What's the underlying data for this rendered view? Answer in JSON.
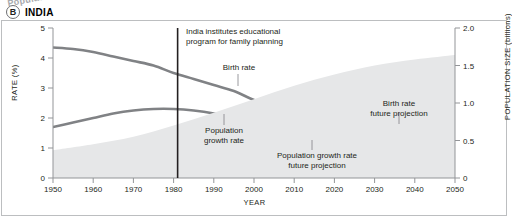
{
  "panel": {
    "letter": "B",
    "title": "INDIA"
  },
  "axes": {
    "left_title": "RATE (%)",
    "right_title": "POPULATION SIZE (billions)",
    "x_title": "YEAR",
    "left_ticks": [
      "0",
      "1",
      "2",
      "3",
      "4",
      "5"
    ],
    "right_ticks": [
      "0",
      "0.5",
      "1.0",
      "1.5",
      "2.0"
    ],
    "x_ticks": [
      "1950",
      "1960",
      "1970",
      "1980",
      "1990",
      "2000",
      "2010",
      "2020",
      "2030",
      "2040",
      "2050"
    ]
  },
  "annotations": {
    "policy_line": "India institutes educational program for family planning",
    "policy_line_1": "India institutes educational",
    "policy_line_2": "program for family planning",
    "birth_rate": "Birth rate",
    "population_growth_rate_1": "Population",
    "population_growth_rate_2": "growth rate",
    "population_size": "Population size",
    "birth_rate_projection_1": "Birth rate",
    "birth_rate_projection_2": "future projection",
    "population_growth_projection_1": "Population growth rate",
    "population_growth_projection_2": "future projection"
  },
  "colors": {
    "line": "#808285",
    "area": "#e6e7e8",
    "marker_line": "#231f20",
    "axis": "#939598",
    "frame": "#bcbec0",
    "popsize_label": "#a7a9ac",
    "text": "#231f20"
  },
  "chart_data": {
    "type": "line",
    "title": "INDIA",
    "xlabel": "YEAR",
    "ylabel": "RATE (%)",
    "ylabel_secondary": "POPULATION SIZE (billions)",
    "xlim": [
      1950,
      2050
    ],
    "ylim": [
      0,
      5
    ],
    "ylim_secondary": [
      0,
      2.0
    ],
    "grid": false,
    "legend": "inline-annotations",
    "marker_line": {
      "year": 1981,
      "label": "India institutes educational program for family planning"
    },
    "projection_start_year": 2018,
    "series": [
      {
        "name": "Birth rate",
        "axis": "left",
        "style": "solid",
        "x": [
          1950,
          1955,
          1960,
          1965,
          1970,
          1975,
          1980,
          1985,
          1990,
          1995,
          2000,
          2005,
          2010,
          2015,
          2018
        ],
        "values": [
          4.35,
          4.3,
          4.2,
          4.05,
          3.9,
          3.75,
          3.5,
          3.3,
          3.1,
          2.9,
          2.6,
          2.4,
          2.25,
          2.15,
          2.1
        ]
      },
      {
        "name": "Birth rate future projection",
        "axis": "left",
        "style": "dotted",
        "x": [
          2018,
          2020,
          2025,
          2030,
          2035,
          2040,
          2045,
          2050
        ],
        "values": [
          2.1,
          2.05,
          1.95,
          1.88,
          1.8,
          1.74,
          1.69,
          1.65
        ]
      },
      {
        "name": "Population growth rate",
        "axis": "left",
        "style": "solid",
        "x": [
          1950,
          1955,
          1960,
          1965,
          1970,
          1975,
          1980,
          1985,
          1990,
          1995,
          2000,
          2005,
          2010,
          2015,
          2018
        ],
        "values": [
          1.7,
          1.85,
          2.0,
          2.15,
          2.25,
          2.3,
          2.3,
          2.25,
          2.15,
          2.0,
          1.85,
          1.65,
          1.45,
          1.3,
          1.2
        ]
      },
      {
        "name": "Population growth rate future projection",
        "axis": "left",
        "style": "dotted",
        "x": [
          2018,
          2020,
          2025,
          2030,
          2035,
          2040,
          2045,
          2050
        ],
        "values": [
          1.2,
          1.1,
          0.95,
          0.8,
          0.62,
          0.45,
          0.3,
          0.18
        ]
      },
      {
        "name": "Population size",
        "axis": "right",
        "style": "area",
        "x": [
          1950,
          1960,
          1970,
          1980,
          1990,
          2000,
          2010,
          2020,
          2030,
          2040,
          2050
        ],
        "values": [
          0.37,
          0.45,
          0.55,
          0.7,
          0.87,
          1.05,
          1.23,
          1.38,
          1.5,
          1.58,
          1.64
        ]
      }
    ]
  }
}
